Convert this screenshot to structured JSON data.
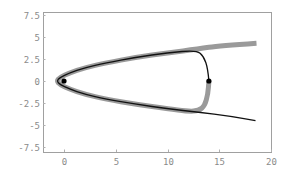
{
  "chart_data": {
    "type": "line",
    "title": "",
    "xlabel": "",
    "ylabel": "",
    "xlim": [
      -2,
      20
    ],
    "ylim": [
      -7.8,
      7.8
    ],
    "grid": false,
    "legend": null,
    "x_ticks": [
      {
        "value": 0,
        "label": "0"
      },
      {
        "value": 5,
        "label": "5"
      },
      {
        "value": 10,
        "label": "10"
      },
      {
        "value": 15,
        "label": "15"
      },
      {
        "value": 20,
        "label": "20"
      }
    ],
    "y_ticks": [
      {
        "value": 7.5,
        "label": "7.5"
      },
      {
        "value": 5,
        "label": "5"
      },
      {
        "value": 2.5,
        "label": "2.5"
      },
      {
        "value": 0,
        "label": "0"
      },
      {
        "value": -2.5,
        "label": "-2.5"
      },
      {
        "value": -5,
        "label": "-5"
      },
      {
        "value": -7.5,
        "label": "-7.5"
      }
    ],
    "series": [
      {
        "name": "gray-thick-trajectory",
        "color": "#9a9a9a",
        "width": 5,
        "points": [
          [
            18.6,
            4.3
          ],
          [
            15,
            4.0
          ],
          [
            13,
            3.65
          ],
          [
            10,
            3.2
          ],
          [
            7,
            2.7
          ],
          [
            4,
            2.05
          ],
          [
            2,
            1.5
          ],
          [
            0.5,
            0.9
          ],
          [
            -0.4,
            0.4
          ],
          [
            -0.7,
            0
          ],
          [
            -0.4,
            -0.4
          ],
          [
            0.5,
            -0.9
          ],
          [
            2,
            -1.5
          ],
          [
            4,
            -2.05
          ],
          [
            7,
            -2.65
          ],
          [
            10,
            -3.15
          ],
          [
            12,
            -3.45
          ],
          [
            13,
            -3.4
          ],
          [
            13.6,
            -2.8
          ],
          [
            13.9,
            -1.5
          ],
          [
            14,
            0
          ]
        ]
      },
      {
        "name": "black-thin-trajectory",
        "color": "#111111",
        "width": 1.3,
        "points": [
          [
            14,
            0
          ],
          [
            13.9,
            1.4
          ],
          [
            13.5,
            2.8
          ],
          [
            12.8,
            3.5
          ],
          [
            10,
            3.2
          ],
          [
            7,
            2.7
          ],
          [
            4,
            2.05
          ],
          [
            2,
            1.5
          ],
          [
            0.5,
            0.9
          ],
          [
            -0.4,
            0.4
          ],
          [
            -0.7,
            0
          ],
          [
            -0.4,
            -0.4
          ],
          [
            0.5,
            -0.9
          ],
          [
            2,
            -1.5
          ],
          [
            4,
            -2.05
          ],
          [
            7,
            -2.65
          ],
          [
            10,
            -3.15
          ],
          [
            13,
            -3.55
          ],
          [
            16,
            -4.0
          ],
          [
            18.5,
            -4.5
          ]
        ]
      }
    ],
    "markers": [
      {
        "name": "start-point",
        "x": 0,
        "y": 0,
        "color": "#000000"
      },
      {
        "name": "turn-point",
        "x": 14,
        "y": 0,
        "color": "#000000"
      }
    ]
  },
  "layout": {
    "frame": {
      "left": 43,
      "top": 12,
      "right": 271,
      "bottom": 152
    },
    "origin_px": {
      "x": 64,
      "y": 81
    },
    "px_per_unit": {
      "x": 10.35,
      "y": 8.8
    },
    "frame_color": "#a0a0a0"
  }
}
